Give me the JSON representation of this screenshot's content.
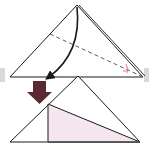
{
  "diagram": {
    "title": "",
    "steps": [
      {
        "id": "step-1",
        "description": "Fold the top corner down along the dashed line",
        "shape": "triangle",
        "fold_line": "valley (dashed)",
        "arrow": "curved fold arrow",
        "marks": "angle bisector marks"
      },
      {
        "id": "step-2",
        "description": "Result: folded flap shown shaded pink",
        "shape": "triangle",
        "flap": "right triangle"
      }
    ],
    "transition_arrow": "down-arrow"
  },
  "colors": {
    "line": "#1a1a1a",
    "background": "#ffffff",
    "flap_fill": "#f6e6f0",
    "angle_mark": "#d9537a",
    "transition_arrow": "#5a2a33",
    "side_bar": "#d9d9d9"
  }
}
